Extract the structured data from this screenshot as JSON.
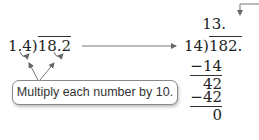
{
  "left_problem": {
    "divisor": "1.4",
    "dividend": "18.2"
  },
  "right_problem": {
    "quotient": "13.",
    "divisor": "14",
    "dividend": "182.",
    "steps": [
      {
        "value": "−14",
        "underlined": true
      },
      {
        "value": "42",
        "underlined": false
      },
      {
        "value": "−42",
        "underlined": true
      },
      {
        "value": "0",
        "underlined": false
      }
    ]
  },
  "callout": {
    "text": "Multiply each number by 10."
  },
  "icons": {
    "transform_arrow": "right-arrow",
    "decimal_point_arrow": "bent-down-arrow",
    "shift_arrows": "curved-arrows"
  },
  "colors": {
    "text": "#222222",
    "arrows": "#666666",
    "callout_border": "#888888"
  }
}
